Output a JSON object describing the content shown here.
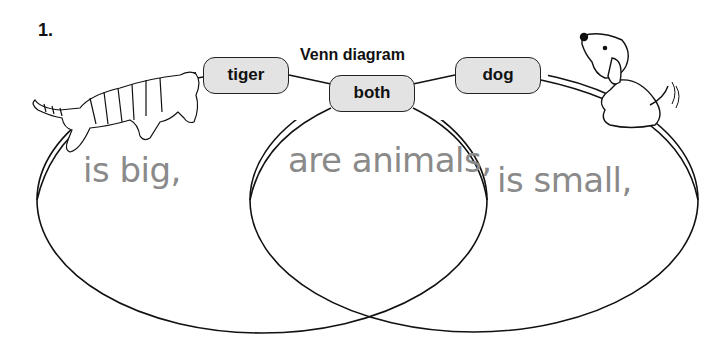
{
  "problem_number": "1.",
  "title": "Venn diagram",
  "labels": {
    "left": "tiger",
    "center": "both",
    "right": "dog"
  },
  "phrases": {
    "left": "is big,",
    "center": "are animals,",
    "right": "is small,"
  },
  "images": {
    "left": "tiger-illustration",
    "right": "dog-illustration"
  },
  "colors": {
    "label_fill": "#e3e3e3",
    "outline": "#222222",
    "phrase_text": "#8a8a8a"
  }
}
